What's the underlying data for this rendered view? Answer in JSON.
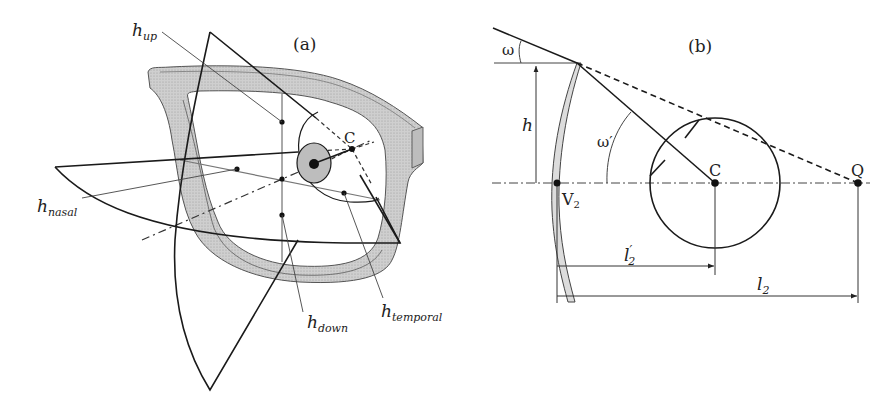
{
  "figure": {
    "panel_a": {
      "label": "(a)",
      "point_c": "C",
      "annotations": [
        {
          "id": "h_up",
          "base": "h",
          "sub": "up"
        },
        {
          "id": "h_nasal",
          "base": "h",
          "sub": "nasal"
        },
        {
          "id": "h_down",
          "base": "h",
          "sub": "down"
        },
        {
          "id": "h_temporal",
          "base": "h",
          "sub": "temporal"
        }
      ]
    },
    "panel_b": {
      "label": "(b)",
      "omega": "ω",
      "omega_prime": "ω′",
      "height": "h",
      "point_c": "C",
      "point_q": "Q",
      "vertex": {
        "base": "V",
        "sub": "2"
      },
      "dim_l2_prime": {
        "base": "l",
        "sub": "2",
        "prime": "′"
      },
      "dim_l2": {
        "base": "l",
        "sub": "2"
      }
    },
    "colors": {
      "line": "#1a1a1a",
      "thin_line": "#555555",
      "frame_fill": "#c8c8c8",
      "lens_fill": "#dcdcdc",
      "eye_fill": "#bdbdbd",
      "background": "#ffffff"
    }
  }
}
